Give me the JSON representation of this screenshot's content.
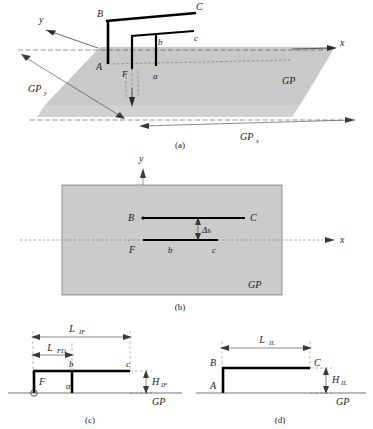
{
  "figure": {
    "panels": [
      {
        "id": "a",
        "caption": "(a)",
        "description": "3-D perspective view of inverted-F and inverted-L antennas over ground plane"
      },
      {
        "id": "b",
        "caption": "(b)",
        "description": "Top (x-y plane) view"
      },
      {
        "id": "c",
        "caption": "(c)",
        "description": "Side elevation of inverted-F antenna"
      },
      {
        "id": "d",
        "caption": "(d)",
        "description": "Side elevation of inverted-L antenna"
      }
    ]
  },
  "panel_a": {
    "caption": "(a)",
    "axis_x": "x",
    "axis_y": "y",
    "ground_plane_label": "GP",
    "dim_y_label": "GP",
    "dim_y_sub": "y",
    "dim_x_label": "GP",
    "dim_x_sub": "x",
    "points": {
      "A": "A",
      "B": "B",
      "C": "C",
      "F": "F",
      "a": "a",
      "b": "b",
      "c": "c"
    }
  },
  "panel_b": {
    "caption": "(b)",
    "axis_x": "x",
    "axis_y": "y",
    "ground_plane_label": "GP",
    "spacing_label": "Δs",
    "points": {
      "B": "B",
      "C": "C",
      "F": "F",
      "b": "b",
      "c": "c"
    }
  },
  "panel_c": {
    "caption": "(c)",
    "ground_plane_label": "GP",
    "length_total_label": "L",
    "length_total_sub": "IF",
    "length_feed_label": "L",
    "length_feed_sub": "FD",
    "height_label": "H",
    "height_sub": "IF",
    "points": {
      "F": "F",
      "a": "a",
      "b": "b",
      "c": "c"
    }
  },
  "panel_d": {
    "caption": "(d)",
    "ground_plane_label": "GP",
    "length_label": "L",
    "length_sub": "IL",
    "height_label": "H",
    "height_sub": "IL",
    "points": {
      "A": "A",
      "B": "B",
      "C": "C"
    }
  }
}
